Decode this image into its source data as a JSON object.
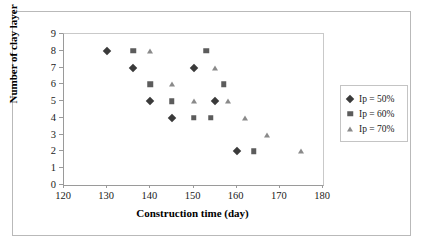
{
  "chart_data": {
    "type": "scatter",
    "title": "",
    "xlabel": "Construction time (day)",
    "ylabel": "Number of clay layer",
    "xlim": [
      120,
      180
    ],
    "ylim": [
      0,
      9
    ],
    "xticks": [
      120,
      130,
      140,
      150,
      160,
      170,
      180
    ],
    "yticks": [
      0,
      1,
      2,
      3,
      4,
      5,
      6,
      7,
      8,
      9
    ],
    "grid": false,
    "legend_position": "right",
    "series": [
      {
        "name": "Ip = 50%",
        "marker": "diamond",
        "color": "#3a3a3a",
        "points": [
          {
            "x": 130,
            "y": 8
          },
          {
            "x": 136,
            "y": 7
          },
          {
            "x": 140,
            "y": 5
          },
          {
            "x": 145,
            "y": 4
          },
          {
            "x": 150,
            "y": 7
          },
          {
            "x": 155,
            "y": 5
          },
          {
            "x": 160,
            "y": 2
          }
        ]
      },
      {
        "name": "Ip = 60%",
        "marker": "square",
        "color": "#5c5c5c",
        "points": [
          {
            "x": 136,
            "y": 8
          },
          {
            "x": 140,
            "y": 6
          },
          {
            "x": 145,
            "y": 5
          },
          {
            "x": 150,
            "y": 4
          },
          {
            "x": 153,
            "y": 8
          },
          {
            "x": 154,
            "y": 4
          },
          {
            "x": 157,
            "y": 6
          },
          {
            "x": 164,
            "y": 2
          }
        ]
      },
      {
        "name": "Ip = 70%",
        "marker": "triangle",
        "color": "#8a8a8a",
        "points": [
          {
            "x": 140,
            "y": 8
          },
          {
            "x": 145,
            "y": 6
          },
          {
            "x": 150,
            "y": 5
          },
          {
            "x": 155,
            "y": 7
          },
          {
            "x": 158,
            "y": 5
          },
          {
            "x": 162,
            "y": 4
          },
          {
            "x": 167,
            "y": 3
          },
          {
            "x": 175,
            "y": 2
          }
        ]
      }
    ]
  }
}
